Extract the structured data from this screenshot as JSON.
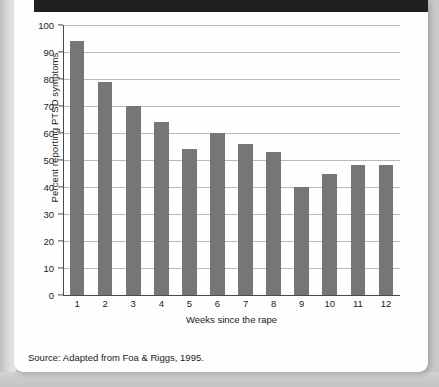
{
  "chart_data": {
    "type": "bar",
    "title": "",
    "xlabel": "Weeks since the rape",
    "ylabel": "Percent reporting PTSD symptoms",
    "categories": [
      "1",
      "2",
      "3",
      "4",
      "5",
      "6",
      "7",
      "8",
      "9",
      "10",
      "11",
      "12"
    ],
    "values": [
      94,
      79,
      70,
      64,
      54,
      60,
      56,
      53,
      40,
      45,
      48,
      48
    ],
    "ylim": [
      0,
      100
    ],
    "yticks": [
      "0",
      "10",
      "20",
      "30",
      "40",
      "50",
      "60",
      "70",
      "80",
      "90",
      "100"
    ],
    "ytick_values": [
      0,
      10,
      20,
      30,
      40,
      50,
      60,
      70,
      80,
      90,
      100
    ],
    "grid": true,
    "legend": false,
    "bar_color": "#767676",
    "gridline_color": "#b9b9b9",
    "axis_color": "#4a4a4a"
  },
  "footer": {
    "source": "Source: Adapted from Foa & Riggs, 1995."
  }
}
